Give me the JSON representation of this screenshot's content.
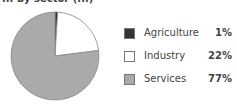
{
  "title": "... by sector (...)",
  "chart_data": {
    "type": "pie",
    "title": "",
    "categories": [
      "Agriculture",
      "Industry",
      "Services"
    ],
    "values": [
      1,
      22,
      77
    ],
    "value_labels": [
      "1%",
      "22%",
      "77%"
    ],
    "colors": [
      "#333333",
      "#ffffff",
      "#aaaaaa"
    ],
    "legend_position": "right",
    "start_angle": "12 o'clock, clockwise"
  },
  "legend": [
    {
      "label": "Agriculture",
      "value": "1%",
      "color": "#333333"
    },
    {
      "label": "Industry",
      "value": "22%",
      "color": "#ffffff"
    },
    {
      "label": "Services",
      "value": "77%",
      "color": "#aaaaaa"
    }
  ]
}
